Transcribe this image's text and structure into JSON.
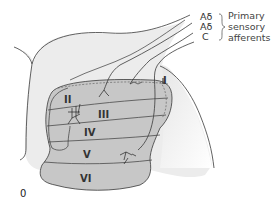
{
  "figure": {
    "panel_label": "0",
    "fibers": {
      "labels": [
        "Aδ",
        "Aδ",
        "C"
      ],
      "group_label_lines": [
        "Primary",
        "sensory",
        "afferents"
      ]
    },
    "laminae": [
      "I",
      "II",
      "III",
      "IV",
      "V",
      "VI"
    ]
  },
  "colors": {
    "lamina_fill": "#c7c7c7",
    "white_matter_fill": "#ececec",
    "outline": "#3a3a3a",
    "background": "#ffffff"
  }
}
